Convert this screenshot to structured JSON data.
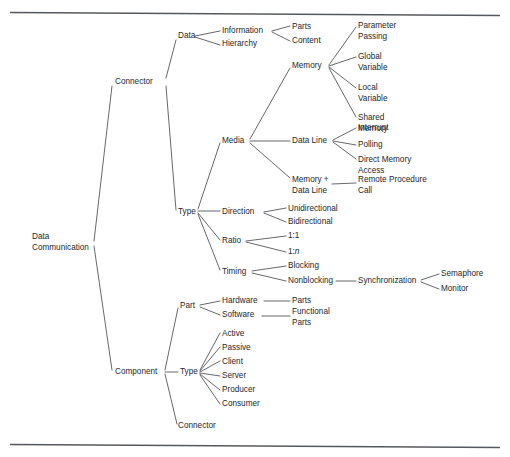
{
  "figure": {
    "type": "taxonomy-tree-diagram",
    "width": 510,
    "height": 457,
    "background_color": "#ffffff",
    "line_color": "#4a4d51",
    "text_color": "#26282b",
    "rule_color": "#55585c"
  },
  "rules": [
    {
      "name": "top-rule",
      "x1": 10,
      "y1": 12.5,
      "x2": 500,
      "y2": 15.5
    },
    {
      "name": "bottom-rule",
      "x1": 10,
      "y1": 444.5,
      "x2": 500,
      "y2": 447.5
    }
  ],
  "nodes": [
    {
      "id": "root",
      "label": "Data",
      "label2": "Communication",
      "x": 32,
      "y": 237,
      "anchor": "start"
    },
    {
      "id": "connector",
      "label": "Connector",
      "x": 115,
      "y": 82,
      "anchor": "start"
    },
    {
      "id": "component",
      "label": "Component",
      "x": 115,
      "y": 372,
      "anchor": "start"
    },
    {
      "id": "data",
      "label": "Data",
      "x": 178,
      "y": 36,
      "anchor": "start"
    },
    {
      "id": "type-conn",
      "label": "Type",
      "x": 178,
      "y": 212,
      "anchor": "start"
    },
    {
      "id": "information",
      "label": "Information",
      "x": 222,
      "y": 31,
      "anchor": "start"
    },
    {
      "id": "hierarchy",
      "label": "Hierarchy",
      "x": 222,
      "y": 44,
      "anchor": "start"
    },
    {
      "id": "parts-info",
      "label": "Parts",
      "x": 292,
      "y": 27,
      "anchor": "start"
    },
    {
      "id": "content",
      "label": "Content",
      "x": 292,
      "y": 41,
      "anchor": "start"
    },
    {
      "id": "memory",
      "label": "Memory",
      "x": 292,
      "y": 66,
      "anchor": "start"
    },
    {
      "id": "param-passing",
      "label": "Parameter",
      "label2": "Passing",
      "x": 358,
      "y": 26,
      "anchor": "start"
    },
    {
      "id": "global-var",
      "label": "Global",
      "label2": "Variable",
      "x": 358,
      "y": 57,
      "anchor": "start"
    },
    {
      "id": "local-var",
      "label": "Local",
      "label2": "Variable",
      "x": 358,
      "y": 88,
      "anchor": "start"
    },
    {
      "id": "shared-memory",
      "label": "Shared",
      "label2": "Memory",
      "x": 358,
      "y": 118,
      "anchor": "start"
    },
    {
      "id": "media",
      "label": "Media",
      "x": 222,
      "y": 141,
      "anchor": "start"
    },
    {
      "id": "data-line",
      "label": "Data Line",
      "x": 292,
      "y": 141,
      "anchor": "start"
    },
    {
      "id": "interrupt",
      "label": "Interrupt",
      "x": 358,
      "y": 128,
      "anchor": "start"
    },
    {
      "id": "polling",
      "label": "Polling",
      "x": 358,
      "y": 145,
      "anchor": "start"
    },
    {
      "id": "dma",
      "label": "Direct Memory",
      "label2": "Access",
      "x": 358,
      "y": 160,
      "anchor": "start"
    },
    {
      "id": "memory-dataline",
      "label": "Memory +",
      "label2": "Data Line",
      "x": 292,
      "y": 180,
      "anchor": "start"
    },
    {
      "id": "rpc",
      "label": "Remote Procedure",
      "label2": "Call",
      "x": 358,
      "y": 180,
      "anchor": "start"
    },
    {
      "id": "direction",
      "label": "Direction",
      "x": 222,
      "y": 212,
      "anchor": "start"
    },
    {
      "id": "unidirectional",
      "label": "Unidirectional",
      "x": 288,
      "y": 209,
      "anchor": "start"
    },
    {
      "id": "bidirectional",
      "label": "Bidirectional",
      "x": 288,
      "y": 222,
      "anchor": "start"
    },
    {
      "id": "ratio",
      "label": "Ratio",
      "x": 222,
      "y": 241,
      "anchor": "start"
    },
    {
      "id": "ratio-1-1",
      "label": "1:1",
      "x": 288,
      "y": 236,
      "anchor": "start"
    },
    {
      "id": "ratio-1-n",
      "label": "1:",
      "label_italic": "n",
      "x": 288,
      "y": 252,
      "anchor": "start"
    },
    {
      "id": "timing",
      "label": "Timing",
      "x": 222,
      "y": 272,
      "anchor": "start"
    },
    {
      "id": "blocking",
      "label": "Blocking",
      "x": 288,
      "y": 266,
      "anchor": "start"
    },
    {
      "id": "nonblocking",
      "label": "Nonblocking",
      "x": 288,
      "y": 281,
      "anchor": "start"
    },
    {
      "id": "synchronization",
      "label": "Synchronization",
      "x": 358,
      "y": 281,
      "anchor": "start"
    },
    {
      "id": "semaphore",
      "label": "Semaphore",
      "x": 441,
      "y": 274,
      "anchor": "start"
    },
    {
      "id": "monitor",
      "label": "Monitor",
      "x": 441,
      "y": 289,
      "anchor": "start"
    },
    {
      "id": "part",
      "label": "Part",
      "x": 180,
      "y": 306,
      "anchor": "start"
    },
    {
      "id": "hardware",
      "label": "Hardware",
      "x": 222,
      "y": 301,
      "anchor": "start"
    },
    {
      "id": "software",
      "label": "Software",
      "x": 222,
      "y": 315,
      "anchor": "start"
    },
    {
      "id": "parts-hw",
      "label": "Parts",
      "x": 292,
      "y": 301,
      "anchor": "start"
    },
    {
      "id": "functional-parts",
      "label": "Functional",
      "label2": "Parts",
      "x": 292,
      "y": 312,
      "anchor": "start"
    },
    {
      "id": "type-comp",
      "label": "Type",
      "x": 180,
      "y": 372,
      "anchor": "start"
    },
    {
      "id": "active",
      "label": "Active",
      "x": 222,
      "y": 334,
      "anchor": "start"
    },
    {
      "id": "passive",
      "label": "Passive",
      "x": 222,
      "y": 348,
      "anchor": "start"
    },
    {
      "id": "client",
      "label": "Client",
      "x": 222,
      "y": 362,
      "anchor": "start"
    },
    {
      "id": "server",
      "label": "Server",
      "x": 222,
      "y": 376,
      "anchor": "start"
    },
    {
      "id": "producer",
      "label": "Producer",
      "x": 222,
      "y": 390,
      "anchor": "start"
    },
    {
      "id": "consumer",
      "label": "Consumer",
      "x": 222,
      "y": 404,
      "anchor": "start"
    },
    {
      "id": "connector-leaf",
      "label": "Connector",
      "x": 178,
      "y": 426,
      "anchor": "start"
    }
  ],
  "edges": [
    {
      "from": "root",
      "to": "connector",
      "x1": 94,
      "y1": 241,
      "x2": 112,
      "y2": 86
    },
    {
      "from": "root",
      "to": "component",
      "x1": 94,
      "y1": 246,
      "x2": 112,
      "y2": 370
    },
    {
      "from": "connector",
      "to": "data",
      "x1": 166,
      "y1": 78,
      "x2": 176,
      "y2": 40
    },
    {
      "from": "connector",
      "to": "type-conn",
      "x1": 166,
      "y1": 86,
      "x2": 176,
      "y2": 210
    },
    {
      "from": "data",
      "to": "information",
      "x1": 195,
      "y1": 36,
      "x2": 220,
      "y2": 31
    },
    {
      "from": "data",
      "to": "hierarchy",
      "x1": 195,
      "y1": 37,
      "x2": 220,
      "y2": 45
    },
    {
      "from": "information",
      "to": "parts-info",
      "x1": 272,
      "y1": 31,
      "x2": 290,
      "y2": 26
    },
    {
      "from": "information",
      "to": "content",
      "x1": 272,
      "y1": 32,
      "x2": 290,
      "y2": 41
    },
    {
      "from": "type-conn",
      "to": "direction",
      "x1": 198,
      "y1": 211,
      "x2": 220,
      "y2": 211
    },
    {
      "from": "type-conn",
      "to": "media",
      "x1": 198,
      "y1": 209,
      "x2": 220,
      "y2": 143
    },
    {
      "from": "type-conn",
      "to": "ratio",
      "x1": 198,
      "y1": 213,
      "x2": 220,
      "y2": 240
    },
    {
      "from": "type-conn",
      "to": "timing",
      "x1": 198,
      "y1": 214,
      "x2": 220,
      "y2": 270
    },
    {
      "from": "media",
      "to": "memory",
      "x1": 250,
      "y1": 139,
      "x2": 290,
      "y2": 68
    },
    {
      "from": "media",
      "to": "data-line",
      "x1": 250,
      "y1": 141,
      "x2": 290,
      "y2": 141
    },
    {
      "from": "media",
      "to": "memory-dataline",
      "x1": 250,
      "y1": 143,
      "x2": 290,
      "y2": 178
    },
    {
      "from": "memory",
      "to": "param-passing",
      "x1": 329,
      "y1": 65,
      "x2": 356,
      "y2": 27
    },
    {
      "from": "memory",
      "to": "global-var",
      "x1": 329,
      "y1": 66,
      "x2": 356,
      "y2": 57
    },
    {
      "from": "memory",
      "to": "local-var",
      "x1": 329,
      "y1": 67,
      "x2": 356,
      "y2": 88
    },
    {
      "from": "memory",
      "to": "shared-memory",
      "x1": 329,
      "y1": 68,
      "x2": 356,
      "y2": 117
    },
    {
      "from": "data-line",
      "to": "interrupt",
      "x1": 333,
      "y1": 140,
      "x2": 356,
      "y2": 128
    },
    {
      "from": "data-line",
      "to": "polling",
      "x1": 333,
      "y1": 141,
      "x2": 356,
      "y2": 145
    },
    {
      "from": "data-line",
      "to": "dma",
      "x1": 333,
      "y1": 142,
      "x2": 356,
      "y2": 159
    },
    {
      "from": "memory-dataline",
      "to": "rpc",
      "x1": 332,
      "y1": 184,
      "x2": 356,
      "y2": 183
    },
    {
      "from": "direction",
      "to": "unidirectional",
      "x1": 264,
      "y1": 212,
      "x2": 286,
      "y2": 208
    },
    {
      "from": "direction",
      "to": "bidirectional",
      "x1": 264,
      "y1": 213,
      "x2": 286,
      "y2": 222
    },
    {
      "from": "ratio",
      "to": "ratio-1-1",
      "x1": 246,
      "y1": 241,
      "x2": 286,
      "y2": 236
    },
    {
      "from": "ratio",
      "to": "ratio-1-n",
      "x1": 246,
      "y1": 242,
      "x2": 286,
      "y2": 252
    },
    {
      "from": "timing",
      "to": "blocking",
      "x1": 252,
      "y1": 271,
      "x2": 286,
      "y2": 266
    },
    {
      "from": "timing",
      "to": "nonblocking",
      "x1": 252,
      "y1": 273,
      "x2": 286,
      "y2": 281
    },
    {
      "from": "nonblocking",
      "to": "synchronization",
      "x1": 336,
      "y1": 281,
      "x2": 356,
      "y2": 281
    },
    {
      "from": "synchronization",
      "to": "semaphore",
      "x1": 421,
      "y1": 280,
      "x2": 439,
      "y2": 274
    },
    {
      "from": "synchronization",
      "to": "monitor",
      "x1": 421,
      "y1": 282,
      "x2": 439,
      "y2": 289
    },
    {
      "from": "component",
      "to": "part",
      "x1": 165,
      "y1": 370,
      "x2": 178,
      "y2": 308
    },
    {
      "from": "component",
      "to": "type-comp",
      "x1": 165,
      "y1": 372,
      "x2": 178,
      "y2": 372
    },
    {
      "from": "component",
      "to": "connector-leaf",
      "x1": 165,
      "y1": 374,
      "x2": 177,
      "y2": 424
    },
    {
      "from": "part",
      "to": "hardware",
      "x1": 200,
      "y1": 305,
      "x2": 220,
      "y2": 301
    },
    {
      "from": "part",
      "to": "software",
      "x1": 200,
      "y1": 307,
      "x2": 220,
      "y2": 315
    },
    {
      "from": "hardware",
      "to": "parts-hw",
      "x1": 264,
      "y1": 301,
      "x2": 290,
      "y2": 301
    },
    {
      "from": "software",
      "to": "functional-parts",
      "x1": 262,
      "y1": 316,
      "x2": 290,
      "y2": 316
    },
    {
      "from": "type-comp",
      "to": "active",
      "x1": 200,
      "y1": 370,
      "x2": 220,
      "y2": 333
    },
    {
      "from": "type-comp",
      "to": "passive",
      "x1": 200,
      "y1": 371,
      "x2": 220,
      "y2": 347
    },
    {
      "from": "type-comp",
      "to": "client",
      "x1": 200,
      "y1": 372,
      "x2": 220,
      "y2": 361
    },
    {
      "from": "type-comp",
      "to": "server",
      "x1": 200,
      "y1": 373,
      "x2": 220,
      "y2": 376
    },
    {
      "from": "type-comp",
      "to": "producer",
      "x1": 200,
      "y1": 374,
      "x2": 220,
      "y2": 390
    },
    {
      "from": "type-comp",
      "to": "consumer",
      "x1": 200,
      "y1": 375,
      "x2": 220,
      "y2": 404
    }
  ]
}
